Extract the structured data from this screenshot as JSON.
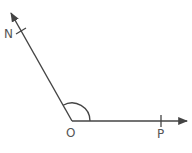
{
  "diagram": {
    "type": "angle",
    "vertex": {
      "label": "O",
      "x": 72,
      "y": 121
    },
    "rays": [
      {
        "name": "ray-OP",
        "end": {
          "x": 187,
          "y": 121
        },
        "point": {
          "label": "P",
          "x": 161,
          "y": 121
        }
      },
      {
        "name": "ray-ON",
        "end": {
          "x": 11,
          "y": 13
        },
        "point": {
          "label": "N",
          "x": 21,
          "y": 31
        }
      }
    ],
    "angle_marker": "arc",
    "colors": {
      "line": "#444444",
      "text": "#555555",
      "background": "#ffffff"
    }
  },
  "labels": {
    "O": "O",
    "P": "P",
    "N": "N"
  }
}
